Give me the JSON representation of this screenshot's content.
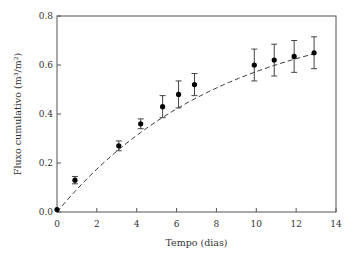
{
  "chart_data": {
    "type": "scatter",
    "title": "",
    "xlabel": "Tempo (dias)",
    "ylabel": "Fluxo cumulativo (m³/m²)",
    "xlim": [
      0,
      14
    ],
    "ylim": [
      0,
      0.8
    ],
    "xticks": [
      "0",
      "2",
      "4",
      "6",
      "8",
      "10",
      "12",
      "14"
    ],
    "yticks": [
      "0.0",
      "0.2",
      "0.4",
      "0.6",
      "0.8"
    ],
    "grid": false,
    "series": [
      {
        "name": "observed",
        "x": [
          0,
          0.9,
          3.1,
          4.2,
          5.3,
          6.1,
          6.9,
          9.9,
          10.9,
          11.9,
          12.9
        ],
        "y": [
          0.01,
          0.13,
          0.27,
          0.36,
          0.43,
          0.48,
          0.52,
          0.6,
          0.62,
          0.635,
          0.65
        ],
        "err": [
          0,
          0.015,
          0.02,
          0.02,
          0.045,
          0.055,
          0.045,
          0.065,
          0.065,
          0.065,
          0.065
        ]
      }
    ],
    "fit": {
      "name": "fitted curve",
      "style": "dashed"
    }
  }
}
